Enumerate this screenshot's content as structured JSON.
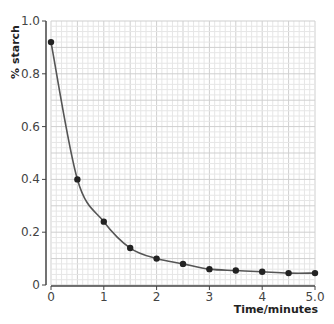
{
  "chart_data": {
    "type": "line",
    "title": "",
    "xlabel": "Time/minutes",
    "ylabel": "% starch",
    "xlim": [
      0,
      5
    ],
    "ylim": [
      0,
      1.0
    ],
    "grid": true,
    "x_ticks": [
      "0",
      "1",
      "2",
      "3",
      "4",
      "5.0"
    ],
    "x_tick_values": [
      0,
      1,
      2,
      3,
      4,
      5
    ],
    "y_ticks": [
      "0",
      "0.2",
      "0.4",
      "0.6",
      "0.8",
      "1.0"
    ],
    "y_tick_values": [
      0,
      0.2,
      0.4,
      0.6,
      0.8,
      1.0
    ],
    "series": [
      {
        "name": "% starch",
        "x": [
          0,
          0.5,
          1,
          1.5,
          2,
          2.5,
          3,
          3.5,
          4,
          4.5,
          5
        ],
        "values": [
          0.92,
          0.4,
          0.24,
          0.14,
          0.1,
          0.08,
          0.06,
          0.055,
          0.05,
          0.045,
          0.045
        ]
      }
    ],
    "colors": {
      "line": "#555555",
      "marker": "#222222",
      "grid_minor": "#e6e6e6",
      "grid_major": "#cfcfcf",
      "axis": "#444444"
    }
  }
}
